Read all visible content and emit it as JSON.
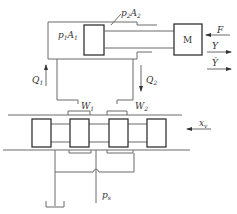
{
  "diagram": {
    "type": "hydraulic servo valve-cylinder schematic",
    "labels": {
      "p1A1": {
        "base": "p",
        "sub1": "1",
        "mid": "A",
        "sub2": "1"
      },
      "p2A2": {
        "base": "p",
        "sub1": "2",
        "mid": "A",
        "sub2": "2"
      },
      "mass": "M",
      "force": "F",
      "displacement": "Y",
      "velocity": "Ẏ",
      "flow1": {
        "base": "Q",
        "sub": "1"
      },
      "flow2": {
        "base": "Q",
        "sub": "2"
      },
      "port1": {
        "base": "W",
        "sub": "1"
      },
      "port2": {
        "base": "W",
        "sub": "2"
      },
      "valve_input": {
        "base": "x",
        "sub": "v"
      },
      "supply": {
        "base": "p",
        "sub": "s"
      }
    },
    "colors": {
      "line": "#6a6a6a",
      "box": "#333333",
      "text": "#333333",
      "background": "#ffffff"
    }
  }
}
